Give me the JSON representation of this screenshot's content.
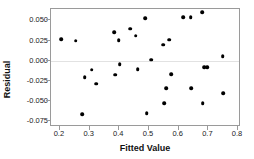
{
  "chart_data": {
    "type": "scatter",
    "title": "",
    "xlabel": "Fitted Value",
    "ylabel": "Residual",
    "xlim": [
      0.17,
      0.81
    ],
    "ylim": [
      -0.082,
      0.064
    ],
    "xticks": [
      0.2,
      0.3,
      0.4,
      0.5,
      0.6,
      0.7,
      0.8
    ],
    "xtick_labels": [
      "0.2",
      "0.3",
      "0.4",
      "0.5",
      "0.6",
      "0.7",
      "0.8"
    ],
    "yticks": [
      0.05,
      0.025,
      0.0,
      -0.025,
      -0.05,
      -0.075
    ],
    "ytick_labels": [
      "0.050",
      "0.025",
      "0.000",
      "-0.025",
      "-0.050",
      "-0.075"
    ],
    "grid": false,
    "zero_reference_line": true,
    "legend": "none",
    "marker": "filled-circle",
    "marker_color": "#000000",
    "frame_color": "#9a9a9a",
    "points": [
      {
        "x": 0.205,
        "y": 0.0265
      },
      {
        "x": 0.253,
        "y": 0.0248
      },
      {
        "x": 0.275,
        "y": -0.0665
      },
      {
        "x": 0.283,
        "y": -0.0205
      },
      {
        "x": 0.307,
        "y": -0.0112
      },
      {
        "x": 0.323,
        "y": -0.0283
      },
      {
        "x": 0.382,
        "y": 0.0352
      },
      {
        "x": 0.387,
        "y": -0.0172
      },
      {
        "x": 0.398,
        "y": 0.0252
      },
      {
        "x": 0.401,
        "y": -0.0045
      },
      {
        "x": 0.436,
        "y": 0.0398
      },
      {
        "x": 0.455,
        "y": 0.0308
      },
      {
        "x": 0.462,
        "y": -0.0107
      },
      {
        "x": 0.488,
        "y": 0.0528
      },
      {
        "x": 0.492,
        "y": -0.0648
      },
      {
        "x": 0.508,
        "y": 0.0013
      },
      {
        "x": 0.548,
        "y": 0.0196
      },
      {
        "x": 0.552,
        "y": -0.0522
      },
      {
        "x": 0.558,
        "y": -0.0338
      },
      {
        "x": 0.568,
        "y": 0.0258
      },
      {
        "x": 0.575,
        "y": -0.0165
      },
      {
        "x": 0.615,
        "y": 0.0542
      },
      {
        "x": 0.64,
        "y": 0.0542
      },
      {
        "x": 0.643,
        "y": -0.0338
      },
      {
        "x": 0.679,
        "y": 0.0602
      },
      {
        "x": 0.681,
        "y": -0.0528
      },
      {
        "x": 0.686,
        "y": -0.0082
      },
      {
        "x": 0.697,
        "y": -0.0082
      },
      {
        "x": 0.748,
        "y": 0.0055
      },
      {
        "x": 0.751,
        "y": -0.0405
      }
    ]
  }
}
